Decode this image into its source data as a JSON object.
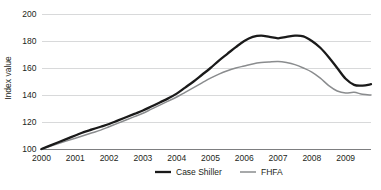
{
  "chart_data": {
    "type": "line",
    "title": "",
    "xlabel": "",
    "ylabel": "Index value",
    "ylim": [
      100,
      200
    ],
    "xlim": [
      2000,
      2009.75
    ],
    "grid": true,
    "legend_position": "bottom",
    "y_ticks": [
      "200",
      "180",
      "160",
      "140",
      "120",
      "100"
    ],
    "y_tick_values": [
      200,
      180,
      160,
      140,
      120,
      100
    ],
    "x_ticks": [
      "2000",
      "2001",
      "2002",
      "2003",
      "2004",
      "2005",
      "2006",
      "2007",
      "2008",
      "2009"
    ],
    "x_tick_values": [
      2000,
      2001,
      2002,
      2003,
      2004,
      2005,
      2006,
      2007,
      2008,
      2009
    ],
    "x": [
      2000.0,
      2000.25,
      2000.5,
      2000.75,
      2001.0,
      2001.25,
      2001.5,
      2001.75,
      2002.0,
      2002.25,
      2002.5,
      2002.75,
      2003.0,
      2003.25,
      2003.5,
      2003.75,
      2004.0,
      2004.25,
      2004.5,
      2004.75,
      2005.0,
      2005.25,
      2005.5,
      2005.75,
      2006.0,
      2006.25,
      2006.5,
      2006.75,
      2007.0,
      2007.25,
      2007.5,
      2007.75,
      2008.0,
      2008.25,
      2008.5,
      2008.75,
      2009.0,
      2009.25,
      2009.5,
      2009.75
    ],
    "series": [
      {
        "name": "Case Shiller",
        "color": "#1a1a1a",
        "width": 2.3,
        "values": [
          100.0,
          102.5,
          105.0,
          107.5,
          110.0,
          112.5,
          114.5,
          116.5,
          118.5,
          121.0,
          123.5,
          126.0,
          128.5,
          131.5,
          134.5,
          137.5,
          141.0,
          145.5,
          150.0,
          155.0,
          160.0,
          165.5,
          170.5,
          175.5,
          180.0,
          183.0,
          184.0,
          183.0,
          182.0,
          183.0,
          184.0,
          183.5,
          180.0,
          175.0,
          168.0,
          160.0,
          152.0,
          147.5,
          147.0,
          148.0
        ]
      },
      {
        "name": "FHFA",
        "color": "#8a8c8e",
        "width": 1.5,
        "values": [
          100.0,
          102.0,
          104.0,
          106.0,
          108.0,
          110.0,
          112.0,
          114.0,
          116.5,
          119.0,
          121.5,
          124.0,
          126.5,
          129.5,
          132.5,
          135.5,
          138.5,
          142.0,
          145.5,
          149.0,
          152.5,
          155.5,
          158.0,
          160.0,
          161.5,
          163.0,
          164.0,
          164.5,
          164.8,
          164.0,
          162.5,
          160.0,
          157.0,
          152.5,
          147.0,
          143.0,
          141.5,
          142.0,
          140.5,
          140.0
        ]
      }
    ],
    "legend": [
      {
        "label": "Case Shiller",
        "color": "#1a1a1a",
        "width": 2.3
      },
      {
        "label": "FHFA",
        "color": "#8a8c8e",
        "width": 1.5
      }
    ]
  }
}
